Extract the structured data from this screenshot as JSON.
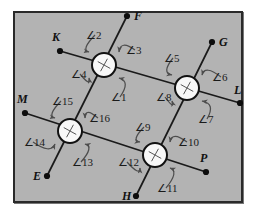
{
  "figure": {
    "background_color": "#b3b3b3",
    "frame_border_color": "#2a2a2a",
    "line_color": "#1a1a1a",
    "arc_color": "#4d4d4d",
    "node_fill": "#f7f7f7"
  },
  "points": [
    {
      "id": "F",
      "label": "F",
      "x": 127,
      "y": 16,
      "label_x": 134,
      "label_y": 10
    },
    {
      "id": "K",
      "label": "K",
      "x": 60,
      "y": 51,
      "label_x": 52,
      "label_y": 31
    },
    {
      "id": "G",
      "label": "G",
      "x": 212,
      "y": 42,
      "label_x": 219,
      "label_y": 36
    },
    {
      "id": "L",
      "label": "L",
      "x": 240,
      "y": 103,
      "label_x": 234,
      "label_y": 84
    },
    {
      "id": "M",
      "label": "M",
      "x": 25,
      "y": 113,
      "label_x": 17,
      "label_y": 93
    },
    {
      "id": "E",
      "label": "E",
      "x": 47,
      "y": 176,
      "label_x": 33,
      "label_y": 170
    },
    {
      "id": "P",
      "label": "P",
      "x": 206,
      "y": 172,
      "label_x": 200,
      "label_y": 152
    },
    {
      "id": "H",
      "label": "H",
      "x": 136,
      "y": 196,
      "label_x": 122,
      "label_y": 190
    }
  ],
  "nodes": [
    {
      "id": "n1",
      "name": "intersection-node-top-left",
      "x": 104,
      "y": 65,
      "r": 12
    },
    {
      "id": "n2",
      "name": "intersection-node-top-right",
      "x": 187,
      "y": 88,
      "r": 12
    },
    {
      "id": "n3",
      "name": "intersection-node-bottom-left",
      "x": 70,
      "y": 131,
      "r": 12
    },
    {
      "id": "n4",
      "name": "intersection-node-bottom-right",
      "x": 155,
      "y": 155,
      "r": 12
    }
  ],
  "lines": [
    {
      "id": "KL",
      "name": "line-K-to-L",
      "x1": 60,
      "y1": 51,
      "x2": 240,
      "y2": 103
    },
    {
      "id": "ME",
      "name": "line-M-to-P",
      "x1": 25,
      "y1": 113,
      "x2": 206,
      "y2": 172
    },
    {
      "id": "FE",
      "name": "line-F-to-E",
      "x1": 127,
      "y1": 16,
      "x2": 47,
      "y2": 176
    },
    {
      "id": "GH",
      "name": "line-G-to-H",
      "x1": 212,
      "y1": 42,
      "x2": 136,
      "y2": 196
    }
  ],
  "angles": [
    {
      "id": "a1",
      "label": "∠1",
      "label_x": 111,
      "label_y": 92,
      "node": "n1",
      "pos": "lower-right"
    },
    {
      "id": "a2",
      "label": "∠2",
      "label_x": 86,
      "label_y": 30,
      "node": "n1",
      "pos": "upper-left"
    },
    {
      "id": "a3",
      "label": "∠3",
      "label_x": 126,
      "label_y": 45,
      "node": "n1",
      "pos": "upper-right"
    },
    {
      "id": "a4",
      "label": "∠4",
      "label_x": 71,
      "label_y": 69,
      "node": "n1",
      "pos": "lower-left"
    },
    {
      "id": "a5",
      "label": "∠5",
      "label_x": 164,
      "label_y": 53,
      "node": "n2",
      "pos": "upper-left"
    },
    {
      "id": "a6",
      "label": "∠6",
      "label_x": 212,
      "label_y": 72,
      "node": "n2",
      "pos": "upper-right"
    },
    {
      "id": "a7",
      "label": "∠7",
      "label_x": 198,
      "label_y": 114,
      "node": "n2",
      "pos": "lower-right"
    },
    {
      "id": "a8",
      "label": "∠8",
      "label_x": 156,
      "label_y": 92,
      "node": "n2",
      "pos": "lower-left"
    },
    {
      "id": "a9",
      "label": "∠9",
      "label_x": 135,
      "label_y": 122,
      "node": "n4",
      "pos": "upper-left"
    },
    {
      "id": "a10",
      "label": "∠10",
      "label_x": 178,
      "label_y": 137,
      "node": "n4",
      "pos": "upper-right"
    },
    {
      "id": "a11",
      "label": "∠11",
      "label_x": 157,
      "label_y": 183,
      "node": "n4",
      "pos": "lower-right"
    },
    {
      "id": "a12",
      "label": "∠12",
      "label_x": 118,
      "label_y": 157,
      "node": "n4",
      "pos": "lower-left"
    },
    {
      "id": "a13",
      "label": "∠13",
      "label_x": 72,
      "label_y": 157,
      "node": "n3",
      "pos": "lower-right"
    },
    {
      "id": "a14",
      "label": "∠14",
      "label_x": 24,
      "label_y": 137,
      "node": "n3",
      "pos": "lower-left"
    },
    {
      "id": "a15",
      "label": "∠15",
      "label_x": 52,
      "label_y": 96,
      "node": "n3",
      "pos": "upper-left"
    },
    {
      "id": "a16",
      "label": "∠16",
      "label_x": 89,
      "label_y": 113,
      "node": "n3",
      "pos": "upper-right"
    }
  ]
}
